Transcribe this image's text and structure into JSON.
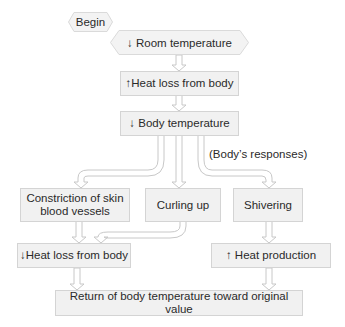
{
  "diagram": {
    "start": "Begin",
    "nodes": {
      "room_temp": "↓ Room temperature",
      "heat_loss_up": "↑Heat loss from body",
      "body_temp_down": "↓ Body temperature",
      "responses_label": "(Body’s responses)",
      "constriction": "Constriction of skin blood vessels",
      "curling": "Curling up",
      "shivering": "Shivering",
      "heat_loss_down": "↓Heat loss from body",
      "heat_production_up": "↑ Heat production",
      "return": "Return of body temperature toward original value"
    },
    "colors": {
      "box_fill": "#f1f1f1",
      "box_border": "#d4d4d4",
      "arrow_fill": "#ffffff",
      "arrow_stroke": "#c8c8c8",
      "text": "#2a2a2a"
    }
  }
}
